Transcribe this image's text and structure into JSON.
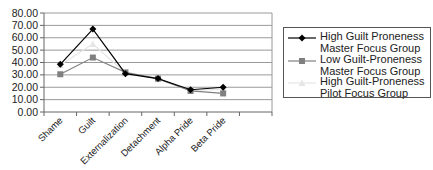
{
  "chart_data": {
    "type": "line",
    "title": "",
    "xlabel": "",
    "ylabel": "",
    "ylim": [
      0,
      80
    ],
    "yticks": [
      "0.00",
      "10.00",
      "20.00",
      "30.00",
      "40.00",
      "50.00",
      "60.00",
      "70.00",
      "80.00"
    ],
    "grid": true,
    "legend_position": "right",
    "categories": [
      "Shame",
      "Guilt",
      "Externalization",
      "Detachment",
      "Alpha Pride",
      "Beta Pride"
    ],
    "series": [
      {
        "name": "High Guilt Proneness Master Focus Group",
        "label_lines": "High Guilt Proneness\nMaster Focus Group",
        "color": "#000000",
        "marker": "diamond",
        "values": [
          38.5,
          67.0,
          31.0,
          27.0,
          18.0,
          20.0
        ]
      },
      {
        "name": "Low Guilt-Proneness Master Focus Group",
        "label_lines": "Low Guilt-Proneness\nMaster Focus Group",
        "color": "#808080",
        "marker": "square",
        "values": [
          30.5,
          44.0,
          32.0,
          27.0,
          17.0,
          15.0
        ]
      },
      {
        "name": "High Guilt-Proneness Pilot Focus Group",
        "label_lines": "High Guilt-Proneness\nPilot Focus Group",
        "color": "#e6e6e6",
        "marker": "triangle",
        "values": [
          38.0,
          55.0,
          31.5,
          26.5,
          17.5,
          18.5
        ]
      }
    ]
  }
}
